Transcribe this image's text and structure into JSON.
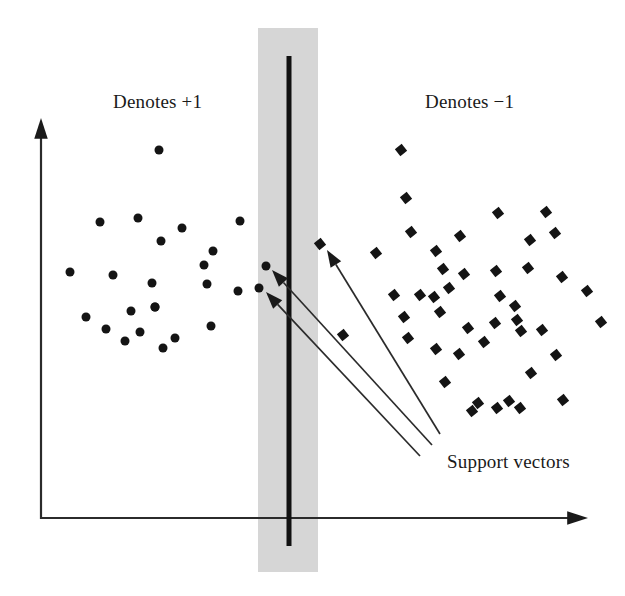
{
  "figure": {
    "background_color": "#ffffff",
    "width": 625,
    "height": 596
  },
  "labels": {
    "positive_class": "Denotes +1",
    "negative_class": "Denotes −1",
    "support_vectors": "Support vectors"
  },
  "colors": {
    "marker": "#141414",
    "margin_band": "#d6d6d6",
    "boundary": "#111111",
    "axis": "#2b2b2b",
    "pointer": "#2b2b2b",
    "text": "#1a1a1a"
  },
  "axes": {
    "origin": {
      "x": 41,
      "y": 518
    },
    "y_axis_top": {
      "x": 41,
      "y": 118
    },
    "x_axis_right": {
      "x": 588,
      "y": 518
    },
    "arrowhead_size": 13
  },
  "margin_band": {
    "x": 258,
    "y": 28,
    "width": 60,
    "height": 544
  },
  "decision_boundary": {
    "x": 289,
    "y_top": 56,
    "y_bottom": 546
  },
  "label_positions": {
    "positive_class": {
      "x": 113,
      "y": 108
    },
    "negative_class": {
      "x": 425,
      "y": 108
    },
    "support_vectors": {
      "x": 447,
      "y": 468
    }
  },
  "chart_data": {
    "type": "scatter",
    "xlabel": "",
    "ylabel": "",
    "grid": false,
    "legend_position": "top",
    "annotations": [
      {
        "text": "Denotes +1",
        "x": 113,
        "y": 108
      },
      {
        "text": "Denotes −1",
        "x": 425,
        "y": 108
      },
      {
        "text": "Support vectors",
        "x": 447,
        "y": 468
      }
    ],
    "series": [
      {
        "name": "Denotes +1",
        "marker": "circle",
        "marker_size": 9,
        "color": "#141414",
        "points": [
          [
            159,
            150
          ],
          [
            138,
            218
          ],
          [
            100,
            222
          ],
          [
            182,
            228
          ],
          [
            240,
            221
          ],
          [
            161,
            241
          ],
          [
            213,
            251
          ],
          [
            204,
            265
          ],
          [
            70,
            272
          ],
          [
            113,
            275
          ],
          [
            207,
            284
          ],
          [
            152,
            283
          ],
          [
            238,
            291
          ],
          [
            155,
            307
          ],
          [
            155,
            307
          ],
          [
            131,
            311
          ],
          [
            86,
            317
          ],
          [
            106,
            329
          ],
          [
            140,
            332
          ],
          [
            175,
            338
          ],
          [
            125,
            341
          ],
          [
            163,
            348
          ],
          [
            211,
            326
          ],
          [
            266,
            266
          ],
          [
            259,
            288
          ]
        ]
      },
      {
        "name": "Denotes −1",
        "marker": "diamond",
        "marker_size": 11,
        "color": "#141414",
        "points": [
          [
            401,
            150
          ],
          [
            406,
            198
          ],
          [
            411,
            232
          ],
          [
            460,
            236
          ],
          [
            376,
            253
          ],
          [
            436,
            251
          ],
          [
            443,
            269
          ],
          [
            449,
            288
          ],
          [
            434,
            297
          ],
          [
            394,
            295
          ],
          [
            420,
            295
          ],
          [
            498,
            213
          ],
          [
            530,
            240
          ],
          [
            546,
            212
          ],
          [
            555,
            233
          ],
          [
            464,
            274
          ],
          [
            496,
            271
          ],
          [
            528,
            268
          ],
          [
            440,
            312
          ],
          [
            404,
            317
          ],
          [
            500,
            296
          ],
          [
            515,
            306
          ],
          [
            468,
            328
          ],
          [
            517,
            320
          ],
          [
            495,
            323
          ],
          [
            562,
            277
          ],
          [
            587,
            291
          ],
          [
            601,
            322
          ],
          [
            408,
            338
          ],
          [
            436,
            349
          ],
          [
            484,
            342
          ],
          [
            521,
            331
          ],
          [
            542,
            330
          ],
          [
            459,
            354
          ],
          [
            556,
            355
          ],
          [
            445,
            382
          ],
          [
            531,
            373
          ],
          [
            509,
            401
          ],
          [
            497,
            408
          ],
          [
            478,
            403
          ],
          [
            563,
            400
          ],
          [
            520,
            408
          ],
          [
            472,
            411
          ],
          [
            320,
            244
          ],
          [
            343,
            335
          ]
        ]
      }
    ],
    "support_vector_pointers": [
      {
        "from": [
          432,
          445
        ],
        "to": [
          272,
          270
        ]
      },
      {
        "from": [
          420,
          456
        ],
        "to": [
          266,
          292
        ]
      },
      {
        "from": [
          440,
          434
        ],
        "to": [
          327,
          250
        ]
      }
    ]
  }
}
